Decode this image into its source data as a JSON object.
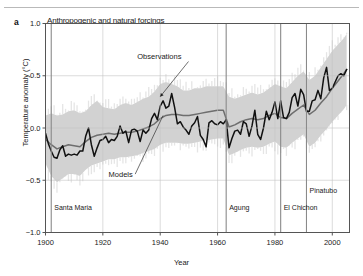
{
  "panel": {
    "label": "a"
  },
  "chart_data": {
    "type": "line",
    "title": "Anthropogenic and natural forcings",
    "xlabel": "Year",
    "ylabel": "Temperature anomaly (°C)",
    "xlim": [
      1900,
      2006
    ],
    "ylim": [
      -1.0,
      1.0
    ],
    "xticks": [
      1900,
      1920,
      1940,
      1960,
      1980,
      2000
    ],
    "yticks": [
      -1.0,
      -0.5,
      0.0,
      0.5,
      1.0
    ],
    "ytick_labels": [
      "−1.0",
      "−0.5",
      "0.0",
      "0.5",
      "1.0"
    ],
    "xtick_labels": [
      "1900",
      "1920",
      "1940",
      "1960",
      "1980",
      "2000"
    ],
    "grid": true,
    "legend_position": "inline-annotations",
    "annotations": [
      {
        "text": "Observations",
        "x": 1932,
        "y": 0.66,
        "target_x": 1940,
        "target_y": 0.3
      },
      {
        "text": "Models",
        "x": 1922,
        "y": -0.47,
        "target_x": 1941,
        "target_y": 0.12
      }
    ],
    "volcano_events": [
      {
        "name": "Santa Maria",
        "year": 1902,
        "label_y": -0.78
      },
      {
        "name": "Agung",
        "year": 1963,
        "label_y": -0.78
      },
      {
        "name": "El Chichon",
        "year": 1982,
        "label_y": -0.78
      },
      {
        "name": "Pinatubo",
        "year": 1991,
        "label_y": -0.62
      }
    ],
    "series": [
      {
        "name": "Observations",
        "color": "#111111",
        "x": [
          1900,
          1901,
          1902,
          1903,
          1904,
          1905,
          1906,
          1907,
          1908,
          1909,
          1910,
          1911,
          1912,
          1913,
          1914,
          1915,
          1916,
          1917,
          1918,
          1919,
          1920,
          1921,
          1922,
          1923,
          1924,
          1925,
          1926,
          1927,
          1928,
          1929,
          1930,
          1931,
          1932,
          1933,
          1934,
          1935,
          1936,
          1937,
          1938,
          1939,
          1940,
          1941,
          1942,
          1943,
          1944,
          1945,
          1946,
          1947,
          1948,
          1949,
          1950,
          1951,
          1952,
          1953,
          1954,
          1955,
          1956,
          1957,
          1958,
          1959,
          1960,
          1961,
          1962,
          1963,
          1964,
          1965,
          1966,
          1967,
          1968,
          1969,
          1970,
          1971,
          1972,
          1973,
          1974,
          1975,
          1976,
          1977,
          1978,
          1979,
          1980,
          1981,
          1982,
          1983,
          1984,
          1985,
          1986,
          1987,
          1988,
          1989,
          1990,
          1991,
          1992,
          1993,
          1994,
          1995,
          1996,
          1997,
          1998,
          1999,
          2000,
          2001,
          2002,
          2003,
          2004,
          2005
        ],
        "values": [
          -0.05,
          -0.15,
          -0.22,
          -0.28,
          -0.29,
          -0.21,
          -0.17,
          -0.27,
          -0.25,
          -0.26,
          -0.25,
          -0.26,
          -0.22,
          -0.22,
          -0.08,
          0.0,
          -0.16,
          -0.27,
          -0.19,
          -0.12,
          -0.11,
          -0.08,
          -0.14,
          -0.11,
          -0.12,
          -0.08,
          0.02,
          -0.05,
          -0.03,
          -0.14,
          -0.02,
          -0.01,
          -0.03,
          -0.13,
          -0.02,
          -0.05,
          -0.02,
          0.09,
          0.14,
          0.08,
          0.21,
          0.26,
          0.19,
          0.21,
          0.33,
          0.2,
          0.04,
          0.06,
          0.01,
          -0.02,
          -0.06,
          0.02,
          0.05,
          0.11,
          -0.07,
          -0.11,
          -0.18,
          0.05,
          0.07,
          0.04,
          0.03,
          0.06,
          0.04,
          0.08,
          -0.19,
          -0.1,
          -0.03,
          -0.02,
          -0.06,
          0.06,
          0.04,
          -0.08,
          0.02,
          0.17,
          -0.06,
          -0.11,
          0.0,
          0.16,
          0.08,
          0.15,
          0.25,
          0.09,
          0.26,
          0.1,
          0.09,
          0.15,
          0.29,
          0.33,
          0.21,
          0.37,
          0.32,
          0.16,
          0.16,
          0.26,
          0.27,
          0.36,
          0.28,
          0.48,
          0.58,
          0.36,
          0.38,
          0.44,
          0.5,
          0.52,
          0.5,
          0.56
        ]
      },
      {
        "name": "Models",
        "color": "#6e6e6e",
        "x": [
          1900,
          1902,
          1904,
          1906,
          1908,
          1910,
          1912,
          1914,
          1916,
          1918,
          1920,
          1922,
          1924,
          1926,
          1928,
          1930,
          1932,
          1934,
          1936,
          1938,
          1940,
          1942,
          1944,
          1946,
          1948,
          1950,
          1952,
          1954,
          1956,
          1958,
          1960,
          1962,
          1964,
          1966,
          1968,
          1970,
          1972,
          1974,
          1976,
          1978,
          1980,
          1982,
          1984,
          1986,
          1988,
          1990,
          1992,
          1994,
          1996,
          1998,
          2000,
          2002,
          2004,
          2005
        ],
        "values": [
          -0.11,
          -0.16,
          -0.2,
          -0.18,
          -0.16,
          -0.17,
          -0.18,
          -0.13,
          -0.09,
          -0.07,
          -0.06,
          -0.05,
          -0.06,
          -0.05,
          -0.04,
          -0.04,
          -0.03,
          -0.01,
          0.01,
          0.04,
          0.09,
          0.12,
          0.13,
          0.13,
          0.12,
          0.12,
          0.13,
          0.14,
          0.15,
          0.16,
          0.17,
          0.17,
          0.01,
          0.03,
          0.06,
          0.08,
          0.09,
          0.08,
          0.09,
          0.12,
          0.14,
          0.1,
          0.09,
          0.14,
          0.18,
          0.22,
          0.13,
          0.17,
          0.24,
          0.3,
          0.38,
          0.45,
          0.52,
          0.56
        ]
      }
    ],
    "band": {
      "name": "Model spread",
      "color": "#d0d0d0",
      "x": [
        1900,
        1902,
        1904,
        1906,
        1908,
        1910,
        1912,
        1914,
        1916,
        1918,
        1920,
        1922,
        1924,
        1926,
        1928,
        1930,
        1932,
        1934,
        1936,
        1938,
        1940,
        1942,
        1944,
        1946,
        1948,
        1950,
        1952,
        1954,
        1956,
        1958,
        1960,
        1962,
        1964,
        1966,
        1968,
        1970,
        1972,
        1974,
        1976,
        1978,
        1980,
        1982,
        1984,
        1986,
        1988,
        1990,
        1992,
        1994,
        1996,
        1998,
        2000,
        2002,
        2004,
        2005
      ],
      "upper": [
        0.12,
        0.14,
        0.12,
        0.13,
        0.16,
        0.17,
        0.14,
        0.16,
        0.22,
        0.26,
        0.2,
        0.19,
        0.18,
        0.22,
        0.24,
        0.22,
        0.25,
        0.28,
        0.3,
        0.35,
        0.42,
        0.44,
        0.42,
        0.4,
        0.36,
        0.36,
        0.38,
        0.38,
        0.4,
        0.4,
        0.4,
        0.4,
        0.3,
        0.28,
        0.3,
        0.32,
        0.34,
        0.32,
        0.34,
        0.38,
        0.42,
        0.4,
        0.38,
        0.44,
        0.5,
        0.54,
        0.46,
        0.5,
        0.58,
        0.66,
        0.74,
        0.8,
        0.86,
        0.9
      ],
      "lower": [
        -0.34,
        -0.46,
        -0.52,
        -0.48,
        -0.44,
        -0.44,
        -0.46,
        -0.4,
        -0.36,
        -0.34,
        -0.32,
        -0.3,
        -0.3,
        -0.28,
        -0.28,
        -0.27,
        -0.26,
        -0.24,
        -0.22,
        -0.2,
        -0.16,
        -0.14,
        -0.14,
        -0.14,
        -0.15,
        -0.15,
        -0.14,
        -0.13,
        -0.12,
        -0.11,
        -0.1,
        -0.1,
        -0.26,
        -0.24,
        -0.21,
        -0.19,
        -0.18,
        -0.19,
        -0.18,
        -0.15,
        -0.13,
        -0.18,
        -0.19,
        -0.14,
        -0.1,
        -0.06,
        -0.18,
        -0.14,
        -0.07,
        -0.01,
        0.06,
        0.12,
        0.18,
        0.22
      ]
    }
  }
}
